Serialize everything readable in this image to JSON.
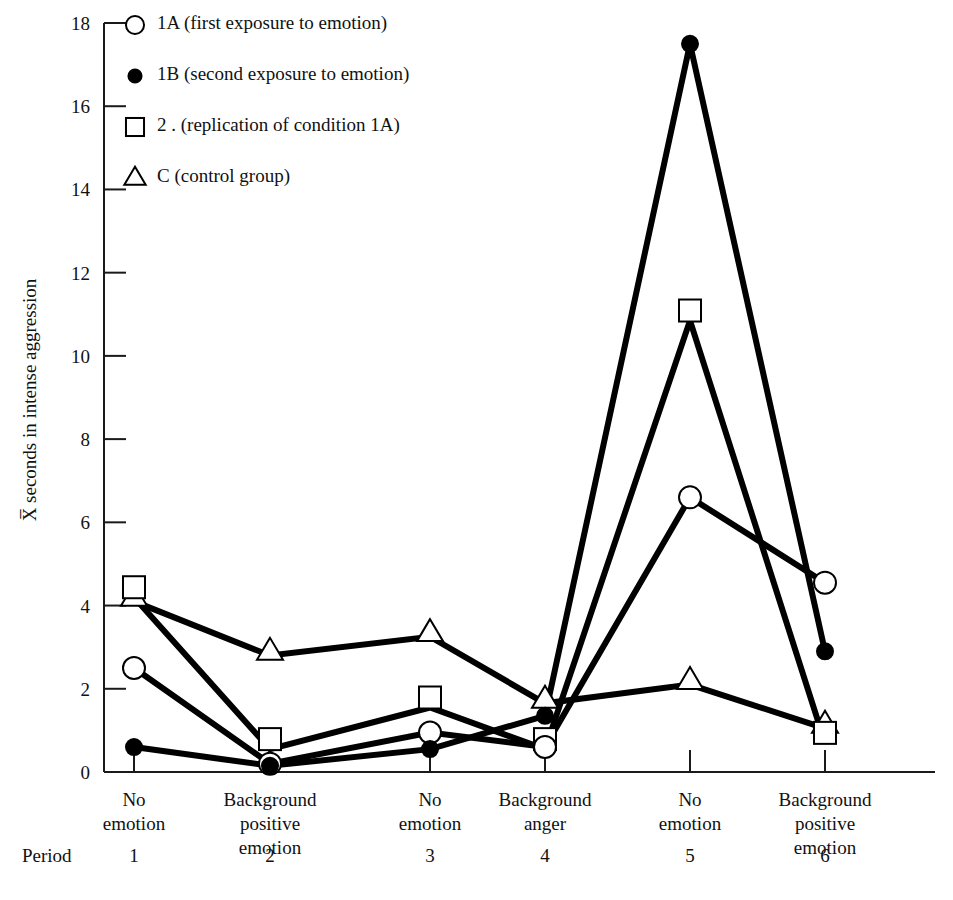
{
  "chart_data": {
    "type": "line",
    "title": "",
    "xlabel": "Period",
    "ylabel": "X̅ seconds in intense aggression",
    "ylim": [
      0,
      18
    ],
    "yticks": [
      0,
      2,
      4,
      6,
      8,
      10,
      12,
      14,
      16,
      18
    ],
    "ytick_labels": [
      "0",
      "2",
      "4",
      "6",
      "8",
      "10",
      "12",
      "14",
      "16",
      "18"
    ],
    "grid": false,
    "legend_position": "top-left",
    "x": [
      1,
      2,
      3,
      4,
      5,
      6
    ],
    "categories": [
      "No emotion",
      "Background positive emotion",
      "No emotion",
      "Background anger",
      "No emotion",
      "Background positive emotion"
    ],
    "category_lines": [
      [
        "No",
        "emotion"
      ],
      [
        "Background",
        "positive",
        "emotion"
      ],
      [
        "No",
        "emotion"
      ],
      [
        "Background",
        "anger"
      ],
      [
        "No",
        "emotion"
      ],
      [
        "Background",
        "positive",
        "emotion"
      ]
    ],
    "period_labels": [
      "1",
      "2",
      "3",
      "4",
      "5",
      "6"
    ],
    "series": [
      {
        "name": "1A (first exposure to emotion)",
        "key": "1A",
        "marker": "open-circle",
        "values": [
          2.5,
          0.2,
          0.95,
          0.6,
          6.6,
          4.55
        ]
      },
      {
        "name": "1B (second exposure to emotion)",
        "key": "1B",
        "marker": "filled-circle",
        "values": [
          0.6,
          0.15,
          0.55,
          1.35,
          17.5,
          2.9
        ]
      },
      {
        "name": "2  (replication of condition 1A)",
        "key": "2",
        "marker": "open-square",
        "values": [
          4.2,
          0.55,
          1.55,
          0.55,
          10.85,
          0.7
        ]
      },
      {
        "name": "C  (control group)",
        "key": "C",
        "marker": "open-triangle",
        "values": [
          4.1,
          2.8,
          3.25,
          1.65,
          2.1,
          1.05
        ]
      }
    ]
  },
  "legend": {
    "items": [
      {
        "marker": "open-circle",
        "label": "1A  (first exposure to emotion)"
      },
      {
        "marker": "filled-circle",
        "label": "1B  (second exposure to emotion)"
      },
      {
        "marker": "open-square",
        "label": "2 .  (replication of condition 1A)"
      },
      {
        "marker": "open-triangle",
        "label": "C   (control group)"
      }
    ]
  },
  "axes": {
    "y_title": "X̅ seconds in intense aggression",
    "x_title": "Period"
  },
  "colors": {
    "line": "#000000",
    "axis": "#1a1a1a",
    "background": "#ffffff",
    "marker_fill": "#ffffff"
  }
}
